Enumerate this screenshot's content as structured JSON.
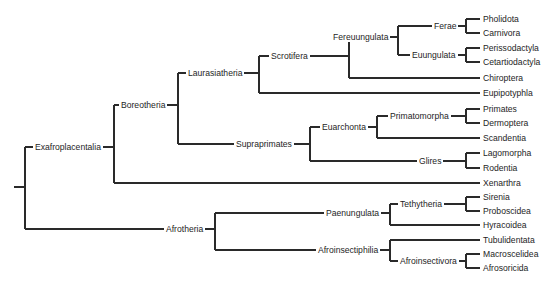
{
  "diagram": {
    "type": "phylogenetic-tree",
    "title": "",
    "line_color": "#2a2a2a",
    "text_color": "#1e1e1e",
    "root": {
      "children": [
        "Exafroplacentalia",
        "Afrotheria"
      ]
    },
    "clades": {
      "Exafroplacentalia": {
        "label": "Exafroplacentalia",
        "children": [
          "Boreotheria",
          "Xenarthra"
        ]
      },
      "Boreotheria": {
        "label": "Boreotheria",
        "children": [
          "Laurasiatheria",
          "Supraprimates"
        ]
      },
      "Laurasiatheria": {
        "label": "Laurasiatheria",
        "children": [
          "Scrotifera",
          "Eupipotyphla"
        ]
      },
      "Scrotifera": {
        "label": "Scrotifera",
        "children": [
          "Fereuungulata",
          "Chiroptera"
        ]
      },
      "Fereuungulata": {
        "label": "Fereuungulata",
        "children": [
          "Ferae",
          "Euungulata"
        ]
      },
      "Ferae": {
        "label": "Ferae",
        "children": [
          "Pholidota",
          "Carnivora"
        ]
      },
      "Euungulata": {
        "label": "Euungulata",
        "children": [
          "Perissodactyla",
          "Cetartiodactyla"
        ]
      },
      "Supraprimates": {
        "label": "Supraprimates",
        "children": [
          "Euarchonta",
          "Glires"
        ]
      },
      "Euarchonta": {
        "label": "Euarchonta",
        "children": [
          "Primatomorpha",
          "Scandentia"
        ]
      },
      "Primatomorpha": {
        "label": "Primatomorpha",
        "children": [
          "Primates",
          "Dermoptera"
        ]
      },
      "Glires": {
        "label": "Glires",
        "children": [
          "Lagomorpha",
          "Rodentia"
        ]
      },
      "Afrotheria": {
        "label": "Afrotheria",
        "children": [
          "Paenungulata",
          "Afroinsectiphilia"
        ]
      },
      "Paenungulata": {
        "label": "Paenungulata",
        "children": [
          "Tethytheria",
          "Hyracoidea"
        ]
      },
      "Tethytheria": {
        "label": "Tethytheria",
        "children": [
          "Sirenia",
          "Proboscidea"
        ]
      },
      "Afroinsectiphilia": {
        "label": "Afroinsectiphilia",
        "children": [
          "Tubulidentata",
          "Afroinsectivora"
        ]
      },
      "Afroinsectivora": {
        "label": "Afroinsectivora",
        "children": [
          "Macroscelidea",
          "Afrosoricida"
        ]
      }
    },
    "leaves": [
      "Pholidota",
      "Carnivora",
      "Perissodactyla",
      "Cetartiodactyla",
      "Chiroptera",
      "Eupipotyphla",
      "Primates",
      "Dermoptera",
      "Scandentia",
      "Lagomorpha",
      "Rodentia",
      "Xenarthra",
      "Sirenia",
      "Proboscidea",
      "Hyracoidea",
      "Tubulidentata",
      "Macroscelidea",
      "Afrosoricida"
    ]
  }
}
